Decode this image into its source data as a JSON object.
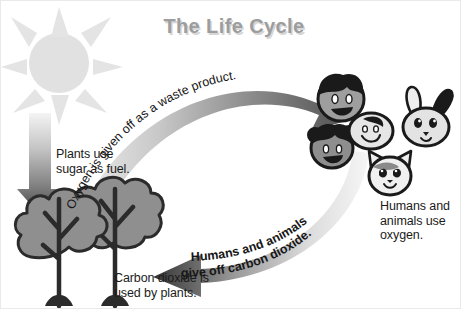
{
  "diagram": {
    "title": "The Life Cycle",
    "background_color": "#ffffff",
    "text_color": "#1b1b1b",
    "title_color": "#9d9d9d"
  },
  "labels": {
    "plants_use_sugar": "Plants use\nsugar as fuel.",
    "carbon_dioxide_used": "Carbon dioxide is\nused by plants.",
    "humans_animals_oxygen": "Humans and\nanimals use\noxygen."
  },
  "arrows": {
    "top_curved": {
      "name": "oxygen-arrow",
      "text": "Oxygen is given off as a waste product.",
      "direction": "left-to-right",
      "color_start": "#e8e8e8",
      "color_end": "#5a5a5a"
    },
    "bottom_curved": {
      "name": "carbon-dioxide-arrow",
      "text_line_1": "Humans and animals",
      "text_line_2": "give off carbon dioxide.",
      "direction": "right-to-left",
      "color_start": "#f2f2f2",
      "color_end": "#3a3a3a"
    },
    "sun_ray": {
      "name": "sunlight-arrow",
      "direction": "downward",
      "color_start": "#f0f0f0",
      "color_end": "#4a4a4a"
    }
  },
  "figures": {
    "sun": {
      "name": "sun",
      "color": "#e0e0e0",
      "rays": 8
    },
    "trees": {
      "name": "trees",
      "count": 2,
      "canopy_color": "#8f8f8f",
      "outline_color": "#2a2a2a"
    },
    "faces": [
      {
        "name": "boy-face",
        "kind": "human"
      },
      {
        "name": "girl-face",
        "kind": "human"
      },
      {
        "name": "baby-face",
        "kind": "human"
      },
      {
        "name": "rabbit-face",
        "kind": "animal"
      },
      {
        "name": "cat-face",
        "kind": "animal"
      }
    ]
  }
}
